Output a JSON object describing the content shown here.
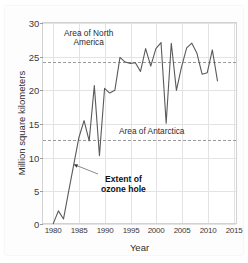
{
  "chart_data": {
    "type": "line",
    "title": "",
    "subtitle": "",
    "xlabel": "Year",
    "ylabel": "Million square kilometers",
    "xlim": [
      1978,
      2016
    ],
    "ylim": [
      0,
      30
    ],
    "xticks": [
      1980,
      1985,
      1990,
      1995,
      2000,
      2005,
      2010,
      2015
    ],
    "yticks": [
      0,
      5,
      10,
      15,
      20,
      25,
      30
    ],
    "grid": true,
    "legend_position": "none",
    "series": [
      {
        "name": "Extent of ozone hole",
        "x": [
          1980,
          1981,
          1982,
          1983,
          1984,
          1985,
          1986,
          1987,
          1988,
          1989,
          1990,
          1991,
          1992,
          1993,
          1994,
          1995,
          1996,
          1997,
          1998,
          1999,
          2000,
          2001,
          2002,
          2003,
          2004,
          2005,
          2006,
          2007,
          2008,
          2009,
          2010,
          2011,
          2012
        ],
        "values": [
          0.2,
          2.1,
          0.9,
          5.0,
          9.0,
          13.0,
          15.5,
          12.5,
          20.7,
          10.3,
          20.3,
          19.6,
          20.0,
          24.9,
          24.2,
          24.0,
          24.1,
          22.8,
          26.2,
          23.6,
          26.2,
          27.1,
          15.1,
          27.0,
          20.0,
          23.5,
          26.3,
          27.0,
          25.5,
          22.4,
          22.6,
          26.0,
          21.4
        ]
      }
    ],
    "reference_lines": [
      {
        "label": "Area of North America",
        "value": 24.2,
        "style": "dashed"
      },
      {
        "label": "Area of Antarctica",
        "value": 12.6,
        "style": "dashed"
      }
    ],
    "annotations": [
      {
        "label": "Extent of ozone hole",
        "points_to_x": 1984,
        "points_to_y": 9.0,
        "bold": true
      }
    ],
    "colors": {
      "line": "#5a5a5a",
      "grid": "#e3e3e3",
      "reference_line": "#9a9a9a",
      "text": "#2f2f2f",
      "background": "#ffffff"
    }
  },
  "labels": {
    "ylabel": "Million square kilometers",
    "xlabel": "Year",
    "annot_north_america_line1": "Area of North",
    "annot_north_america_line2": "America",
    "annot_antarctica": "Area of Antarctica",
    "annot_ozone_line1": "Extent of",
    "annot_ozone_line2": "ozone hole",
    "ytick_0": "0",
    "ytick_5": "5",
    "ytick_10": "10",
    "ytick_15": "15",
    "ytick_20": "20",
    "ytick_25": "25",
    "ytick_30": "30",
    "xtick_1980": "1980",
    "xtick_1985": "1985",
    "xtick_1990": "1990",
    "xtick_1995": "1995",
    "xtick_2000": "2000",
    "xtick_2005": "2005",
    "xtick_2010": "2010",
    "xtick_2015": "2015"
  }
}
